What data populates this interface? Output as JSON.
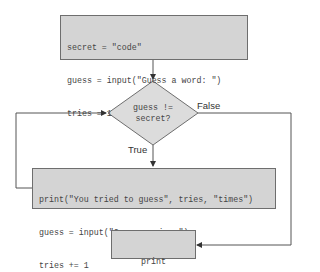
{
  "flowchart": {
    "init_box": {
      "lines": [
        "secret = \"code\"",
        "guess = input(\"Guess a word: \")",
        "tries = 1"
      ]
    },
    "decision": {
      "lines": [
        "guess !=",
        "secret?"
      ],
      "true_label": "True",
      "false_label": "False"
    },
    "loop_box": {
      "lines": [
        "print(\"You tried to guess\", tries, \"times\")",
        "guess = input(\"Guess again: \")",
        "tries += 1"
      ]
    },
    "end_box": {
      "lines": [
        "print",
        "(\"You got it!\")"
      ]
    },
    "colors": {
      "box_fill": "#d4d4d4",
      "stroke": "#6e6e6e",
      "text": "#444444"
    }
  }
}
